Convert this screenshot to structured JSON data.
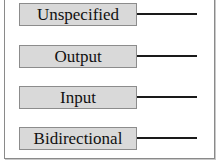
{
  "ports": [
    {
      "label": "Unspecified",
      "direction": "unspecified"
    },
    {
      "label": "Output",
      "direction": "output"
    },
    {
      "label": "Input",
      "direction": "input"
    },
    {
      "label": "Bidirectional",
      "direction": "bidirectional"
    }
  ],
  "colors": {
    "box_fill": "#d9d9d9",
    "box_border": "#8c8c8c",
    "line": "#1a1a1a",
    "frame": "#8a8a8a"
  }
}
